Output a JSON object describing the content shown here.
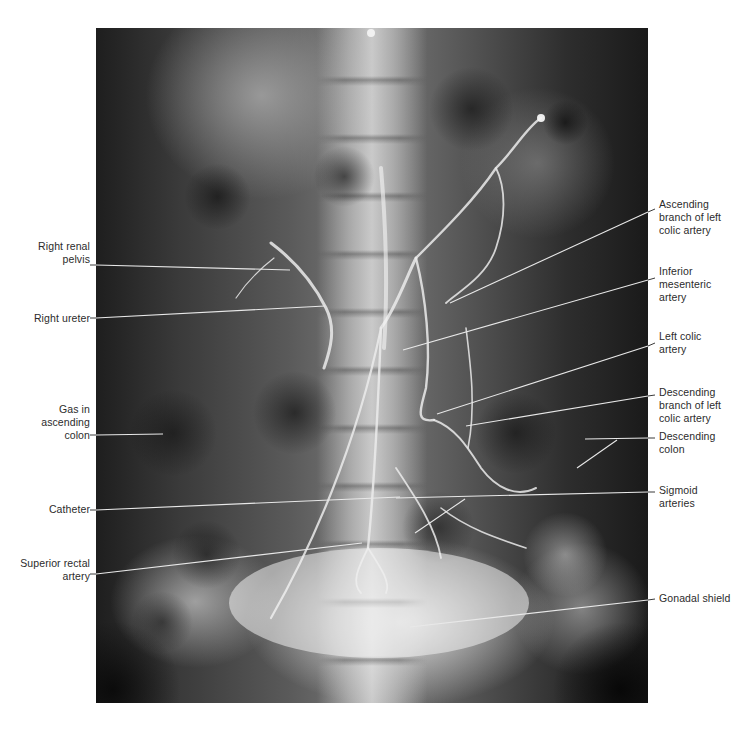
{
  "figure": {
    "type": "annotated-radiograph"
  },
  "labels_left": [
    {
      "id": "right-renal-pelvis",
      "text": "Right renal\npelvis",
      "x": 20,
      "y": 240,
      "w": 70,
      "line": [
        94,
        264,
        290,
        270
      ]
    },
    {
      "id": "right-ureter",
      "text": "Right ureter",
      "x": 10,
      "y": 312,
      "w": 80,
      "line": [
        94,
        318,
        325,
        306
      ]
    },
    {
      "id": "gas-in-ascending-colon",
      "text": "Gas in\nascending\ncolon",
      "x": 20,
      "y": 403,
      "w": 70,
      "line": [
        94,
        435,
        163,
        434
      ]
    },
    {
      "id": "catheter",
      "text": "Catheter",
      "x": 20,
      "y": 503,
      "w": 70,
      "line": [
        94,
        510,
        400,
        497
      ]
    },
    {
      "id": "superior-rectal-artery",
      "text": "Superior rectal\nartery",
      "x": 0,
      "y": 557,
      "w": 90,
      "line": [
        94,
        574,
        362,
        543
      ]
    }
  ],
  "labels_right": [
    {
      "id": "ascending-branch-left-colic",
      "text": "Ascending\nbranch of  left\ncolic artery",
      "x": 659,
      "y": 198,
      "w": 96,
      "line": [
        654,
        209,
        450,
        303
      ]
    },
    {
      "id": "inferior-mesenteric-artery",
      "text": "Inferior\nmesenteric\nartery",
      "x": 659,
      "y": 265,
      "w": 96,
      "line": [
        654,
        278,
        403,
        350
      ]
    },
    {
      "id": "left-colic-artery",
      "text": "Left colic\nartery",
      "x": 659,
      "y": 330,
      "w": 96,
      "line": [
        654,
        343,
        437,
        414
      ]
    },
    {
      "id": "descending-branch-left-colic",
      "text": "Descending\nbranch of left\ncolic artery",
      "x": 659,
      "y": 386,
      "w": 96,
      "line": [
        654,
        395,
        466,
        426
      ]
    },
    {
      "id": "descending-colon",
      "text": "Descending\ncolon",
      "x": 659,
      "y": 430,
      "w": 96,
      "line": [
        654,
        438,
        585,
        439
      ],
      "line2": [
        617,
        440,
        577,
        468
      ]
    },
    {
      "id": "sigmoid-arteries",
      "text": "Sigmoid\narteries",
      "x": 659,
      "y": 484,
      "w": 96,
      "line": [
        654,
        492,
        396,
        498
      ],
      "line2": [
        465,
        499,
        415,
        533
      ]
    },
    {
      "id": "gonadal-shield",
      "text": "Gonadal shield",
      "x": 659,
      "y": 592,
      "w": 96,
      "line": [
        654,
        599,
        410,
        627
      ]
    }
  ],
  "colors": {
    "label_text": "#2b2b2b",
    "leader_line_on_image": "#e8e8e8",
    "leader_line_on_white": "#3a3a3a",
    "background": "#ffffff"
  }
}
